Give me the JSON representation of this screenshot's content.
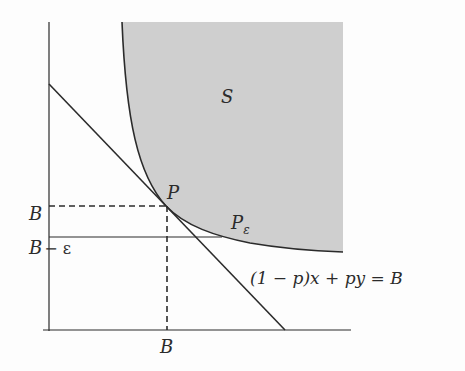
{
  "diagram": {
    "colors": {
      "region_fill": "#cfcfcf",
      "stroke": "#2b2b2b",
      "background": "#fdfdfd"
    },
    "labels": {
      "region": "S",
      "tangent_point": "P",
      "eps_point": "P",
      "eps_point_sub": "ε",
      "y_tick_B": "B",
      "y_tick_B_eps_B": "B",
      "y_tick_B_eps_rest": "− ε",
      "x_tick_B": "B",
      "line_equation": "(1 − p)x + py = B"
    }
  }
}
